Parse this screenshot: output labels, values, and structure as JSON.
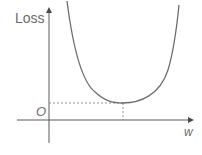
{
  "diagram": {
    "y_axis_label": "Loss",
    "x_axis_label": "w",
    "origin_label": "O",
    "curve": {
      "shape": "convex U-shaped",
      "minimum_marked": true
    },
    "colors": {
      "axis": "#5a5a5a",
      "curve": "#6e6e6e",
      "dashed": "#8a8a8a",
      "text": "#6b6b6b"
    }
  }
}
